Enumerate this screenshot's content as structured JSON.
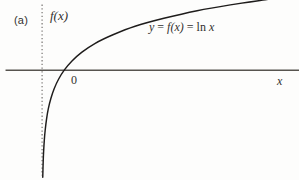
{
  "figure": {
    "panel_label": "(a)",
    "background_color": "#fdfdfc",
    "ink_color": "#33312f",
    "axis_color": "#555251",
    "curve_color": "#1e1c1b"
  },
  "labels": {
    "y_axis": "f(x)",
    "x_axis": "x",
    "origin": "0",
    "equation": "y = f(x) = ln x",
    "equation_parts": {
      "y": "y",
      "eq1": " = ",
      "fx": "f(x)",
      "eq2": " = ",
      "ln": "ln",
      "x": "x"
    }
  },
  "chart_data": {
    "type": "line",
    "title": "",
    "subtitle": "",
    "xlabel": "x",
    "ylabel": "f(x)",
    "annotations": [
      {
        "text": "y = f(x) = ln x",
        "x": 3.4,
        "y": 1.55
      },
      {
        "text": "0",
        "x": -0.18,
        "y": -0.22
      },
      {
        "text": "(a)",
        "x": -1.9,
        "y": 1.9
      }
    ],
    "grid": false,
    "legend": false,
    "xlim": [
      -1.9,
      11.6
    ],
    "ylim": [
      -3.6,
      2.3
    ],
    "x_axis_drawn_from": -1.65,
    "x_axis_drawn_to": 11.7,
    "y_axis_style": "dotted",
    "y_axis_from": -3.45,
    "y_axis_to": 2.15,
    "series": [
      {
        "name": "ln x",
        "function": "ln(x)",
        "x": [
          0.03,
          0.05,
          0.07,
          0.1,
          0.14,
          0.2,
          0.28,
          0.4,
          0.55,
          0.75,
          1.0,
          1.35,
          1.8,
          2.4,
          3.2,
          4.2,
          5.5,
          7.0,
          8.5,
          10.2
        ],
        "y": [
          -3.51,
          -3.0,
          -2.66,
          -2.3,
          -1.97,
          -1.61,
          -1.27,
          -0.92,
          -0.6,
          -0.29,
          0.0,
          0.3,
          0.59,
          0.88,
          1.16,
          1.44,
          1.7,
          1.95,
          2.14,
          2.32
        ]
      }
    ]
  }
}
